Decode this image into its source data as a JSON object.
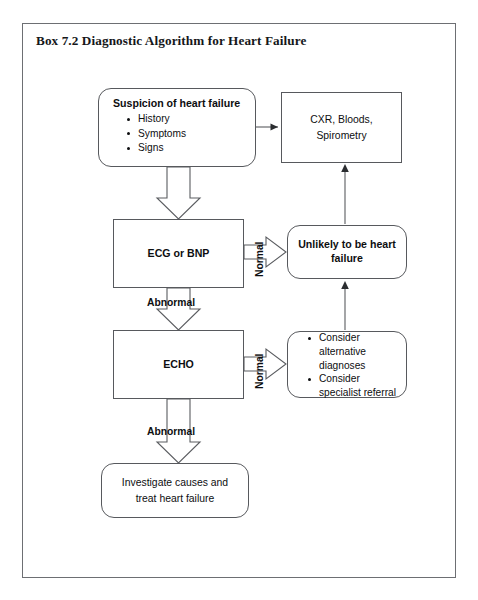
{
  "figure": {
    "title": "Box 7.2 Diagnostic Algorithm for Heart Failure"
  },
  "nodes": {
    "suspicion": {
      "heading": "Suspicion of heart failure",
      "bullets": [
        "History",
        "Symptoms",
        "Signs"
      ]
    },
    "cxr": {
      "line1": "CXR, Bloods,",
      "line2": "Spirometry"
    },
    "ecg": {
      "label": "ECG or BNP"
    },
    "unlikely": {
      "line1": "Unlikely to be heart",
      "line2": "failure"
    },
    "echo": {
      "label": "ECHO"
    },
    "consider": {
      "bullets": [
        "Consider alternative diagnoses",
        "Consider specialist referral"
      ]
    },
    "investigate": {
      "line1": "Investigate causes and",
      "line2": "treat heart failure"
    }
  },
  "edge_labels": {
    "abnormal_ecg": "Abnormal",
    "abnormal_echo": "Abnormal",
    "normal_ecg": "Normal",
    "normal_echo": "Normal"
  },
  "colors": {
    "page_background": "#ffffff",
    "border": "#6d6f73",
    "node_stroke": "#57595d",
    "text": "#0d0e10",
    "connector": "#5a5c60"
  }
}
